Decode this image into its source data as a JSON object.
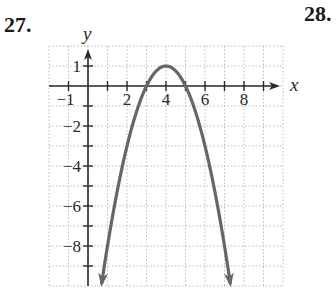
{
  "problems": {
    "left_number": "27.",
    "right_number": "28."
  },
  "chart_data": {
    "type": "line",
    "title": "",
    "function": "y = -(x - 4)^2 + 1",
    "xlabel": "x",
    "ylabel": "y",
    "xlim": [
      -2,
      10
    ],
    "ylim": [
      -10,
      2
    ],
    "grid": true,
    "grid_style": "dotted",
    "legend": null,
    "x_tick_labels": [
      "-1",
      "2",
      "4",
      "6",
      "8"
    ],
    "x_tick_values": [
      -1,
      2,
      4,
      6,
      8
    ],
    "y_tick_labels": [
      "1",
      "-2",
      "-4",
      "-6",
      "-8"
    ],
    "y_tick_values": [
      1,
      -2,
      -4,
      -6,
      -8
    ],
    "vertex": [
      4,
      1
    ],
    "x_intercepts": [
      3,
      5
    ],
    "series": [
      {
        "name": "parabola",
        "color": "#666666",
        "x": [
          0.3,
          1,
          2,
          3,
          3.5,
          4,
          4.5,
          5,
          6,
          7,
          7.7
        ],
        "y": [
          -12.69,
          -8,
          -3,
          0,
          0.75,
          1,
          0.75,
          0,
          -3,
          -8,
          -12.69
        ],
        "arrows": "both ends (downward)"
      }
    ]
  },
  "colors": {
    "curve": "#666666",
    "axis": "#2a2a2a",
    "grid": "#bdbdbd"
  }
}
